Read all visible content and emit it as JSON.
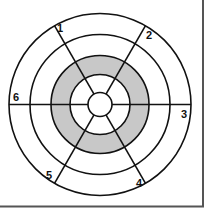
{
  "diagram": {
    "type": "concentric-rings-with-spokes",
    "center": {
      "x": 100,
      "y": 104.5
    },
    "rings": [
      {
        "name": "outer",
        "radius": 91
      },
      {
        "name": "second",
        "radius": 70
      },
      {
        "name": "shaded-outer",
        "radius": 49
      },
      {
        "name": "shaded-inner",
        "radius": 30
      },
      {
        "name": "center",
        "radius": 12
      }
    ],
    "shaded_band": {
      "outer_radius": 49,
      "inner_radius": 30,
      "color": "#c8c8c8"
    },
    "spokes": [
      {
        "from_label": "1",
        "to_label": "4",
        "angle_deg": -120
      },
      {
        "from_label": "2",
        "to_label": "5",
        "angle_deg": -60
      },
      {
        "from_label": "6",
        "to_label": "3",
        "angle_deg": 180
      }
    ],
    "labels": [
      {
        "text": "1",
        "x": 57,
        "y": 32
      },
      {
        "text": "2",
        "x": 146,
        "y": 39
      },
      {
        "text": "3",
        "x": 181,
        "y": 118
      },
      {
        "text": "4",
        "x": 136,
        "y": 187
      },
      {
        "text": "5",
        "x": 46,
        "y": 179
      },
      {
        "text": "6",
        "x": 13,
        "y": 101
      }
    ],
    "colors": {
      "stroke": "#111111",
      "shade": "#c8c8c8",
      "background": "#ffffff",
      "frame": "#555555"
    }
  }
}
